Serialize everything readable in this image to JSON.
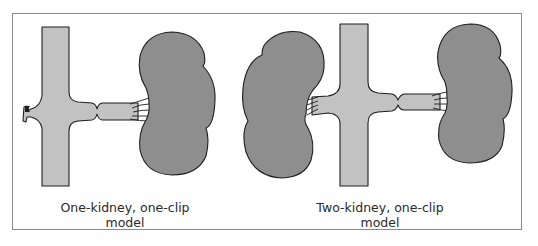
{
  "figure": {
    "panels": [
      {
        "id": "one-kidney-one-clip",
        "caption_line1": "One-kidney, one-clip",
        "caption_line2": "model",
        "elements": [
          "aorta",
          "clamped-renal-artery",
          "ligated-stump",
          "kidney"
        ]
      },
      {
        "id": "two-kidney-one-clip",
        "caption_line1": "Two-kidney, one-clip",
        "caption_line2": "model",
        "elements": [
          "aorta",
          "unclipped-renal-artery",
          "clamped-renal-artery",
          "kidney-left",
          "kidney-right"
        ]
      }
    ],
    "colors": {
      "vessel_fill": "#c2c2c2",
      "kidney_fill": "#8e8e8e",
      "outline": "#1e1e1e",
      "frame_border": "#8a8a8a",
      "background": "#ffffff"
    }
  }
}
